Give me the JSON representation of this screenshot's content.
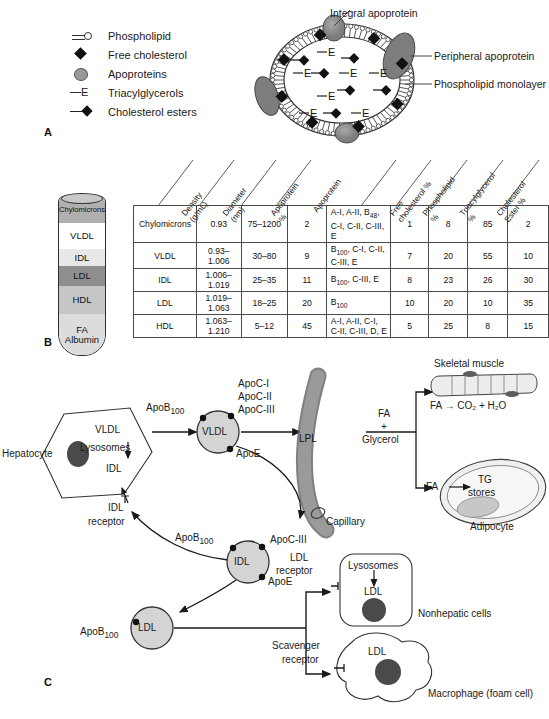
{
  "panels": {
    "a_letter": "A",
    "b_letter": "B",
    "c_letter": "C"
  },
  "panel_a": {
    "legend": [
      {
        "icon": "phospholipid-icon",
        "label": "Phospholipid"
      },
      {
        "icon": "free-cholesterol-diamond-icon",
        "label": "Free cholesterol"
      },
      {
        "icon": "apoprotein-ellipse-icon",
        "label": "Apoproteins"
      },
      {
        "icon": "triacylglycerol-icon",
        "label": "Triacylglycerols"
      },
      {
        "icon": "cholesterol-ester-icon",
        "label": "Cholesterol esters"
      }
    ],
    "callouts": {
      "integral": "Integral apoprotein",
      "peripheral": "Peripheral apoprotein",
      "monolayer": "Phospholipid monolayer"
    },
    "core_symbol": "E"
  },
  "panel_b": {
    "tube_bands": [
      {
        "label": "Chylomicrons",
        "shade": "#b0b0b0"
      },
      {
        "label": "VLDL",
        "shade": "#ffffff"
      },
      {
        "label": "IDL",
        "shade": "#e8e8e8"
      },
      {
        "label": "LDL",
        "shade": "#8e8e8e"
      },
      {
        "label": "HDL",
        "shade": "#c6c6c6"
      },
      {
        "label": "FA",
        "label2": "Albumin",
        "shade": "#dcdcdc"
      }
    ],
    "table": {
      "headers": [
        "Density (g/mL)",
        "Diameter (nm)",
        "Apoprotein %",
        "Apoprotein",
        "Free cholesterol %",
        "Phospholipid %",
        "Triacylglycerol %",
        "Cholesterol Ester %"
      ],
      "rows": [
        {
          "lipoprotein": "Chylomicrons",
          "density": "0.93",
          "diameter": "75–1200",
          "apoprotein_pct": "2",
          "apoproteins": "A-I, A-II, B<sub>48</sub>, C-I, C-II, C-III, E",
          "free_cholesterol": "1",
          "phospholipid": "8",
          "triacylglycerol": "85",
          "cholesterol_ester": "2"
        },
        {
          "lipoprotein": "VLDL",
          "density": "0.93–1.006",
          "diameter": "30–80",
          "apoprotein_pct": "9",
          "apoproteins": "B<sub>100</sub>, C-I, C-II, C-III, E",
          "free_cholesterol": "7",
          "phospholipid": "20",
          "triacylglycerol": "55",
          "cholesterol_ester": "10"
        },
        {
          "lipoprotein": "IDL",
          "density": "1.006–1.019",
          "diameter": "25–35",
          "apoprotein_pct": "11",
          "apoproteins": "B<sub>100</sub>, C-III, E",
          "free_cholesterol": "8",
          "phospholipid": "23",
          "triacylglycerol": "26",
          "cholesterol_ester": "30"
        },
        {
          "lipoprotein": "LDL",
          "density": "1.019–1.063",
          "diameter": "18–25",
          "apoprotein_pct": "20",
          "apoproteins": "B<sub>100</sub>",
          "free_cholesterol": "10",
          "phospholipid": "20",
          "triacylglycerol": "10",
          "cholesterol_ester": "35"
        },
        {
          "lipoprotein": "HDL",
          "density": "1.063–1.210",
          "diameter": "5–12",
          "apoprotein_pct": "45",
          "apoproteins": "A-I, A-II, C-I, C-II, C-III, D, E",
          "free_cholesterol": "5",
          "phospholipid": "25",
          "triacylglycerol": "8",
          "cholesterol_ester": "15"
        }
      ]
    }
  },
  "panel_c": {
    "hepatocyte": "Hepatocyte",
    "hep_vldl": "VLDL",
    "hep_lysosomes": "Lysosomes",
    "hep_idl": "IDL",
    "idl_receptor": "IDL\nreceptor",
    "idl_receptor_l1": "IDL",
    "idl_receptor_l2": "receptor",
    "vldl_particle": "VLDL",
    "vldl_apob": "ApoB<sub>100</sub>",
    "vldl_apoc1": "ApoC-I",
    "vldl_apoc2": "ApoC-II",
    "vldl_apoc3": "ApoC-III",
    "vldl_apoe": "ApoE",
    "lpl": "LPL",
    "capillary": "Capillary",
    "fa_glycerol_l1": "FA",
    "fa_glycerol_l2": "+",
    "fa_glycerol_l3": "Glycerol",
    "skeletal_muscle": "Skeletal muscle",
    "muscle_eq": "FA → CO₂ + H₂O",
    "adipocyte": "Adipocyte",
    "adipo_fa": "FA",
    "adipo_tg_l1": "TG",
    "adipo_tg_l2": "stores",
    "idl_particle": "IDL",
    "idl_apob": "ApoB<sub>100</sub>",
    "idl_apoc3": "ApoC-III",
    "idl_apoe": "ApoE",
    "ldl_particle": "LDL",
    "ldl_apob": "ApoB<sub>100</sub>",
    "ldl_receptor_l1": "LDL",
    "ldl_receptor_l2": "receptor",
    "scavenger_l1": "Scavenger",
    "scavenger_l2": "receptor",
    "nonhepatic_lysosomes": "Lysosomes",
    "nonhepatic_ldl": "LDL",
    "nonhepatic_cells": "Nonhepatic cells",
    "macrophage_ldl": "LDL",
    "macrophage": "Macrophage (foam cell)"
  }
}
